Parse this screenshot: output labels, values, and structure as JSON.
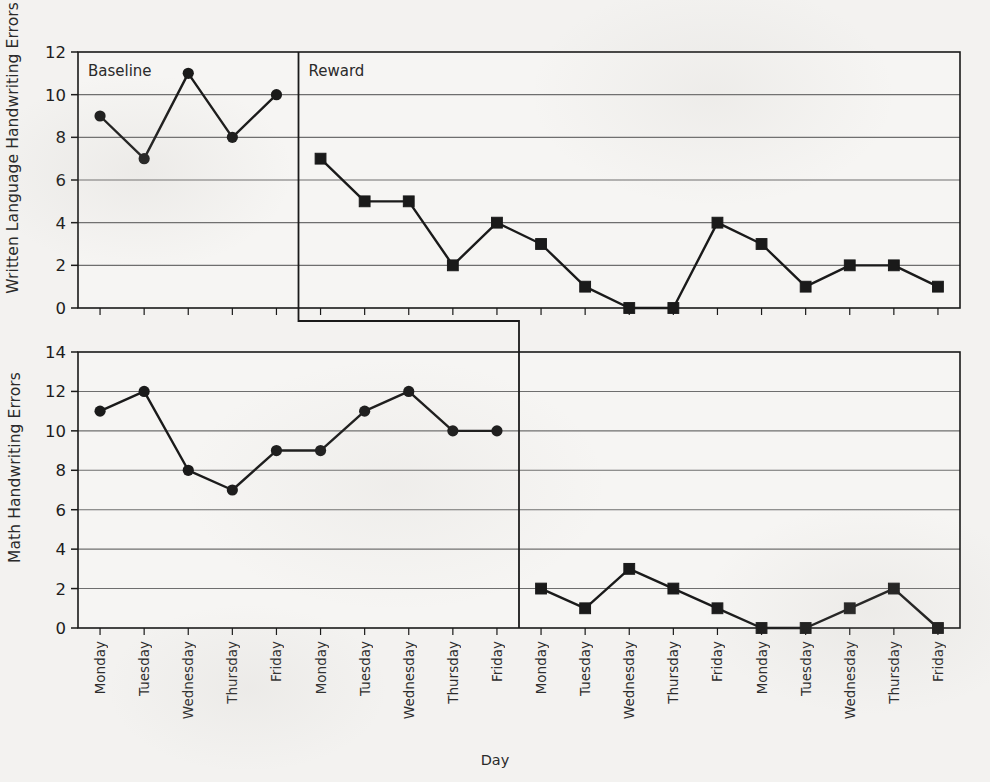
{
  "figure": {
    "xlabel": "Day",
    "x_tick_labels": [
      "Monday",
      "Tuesday",
      "Wednesday",
      "Thursday",
      "Friday",
      "Monday",
      "Tuesday",
      "Wednesday",
      "Thursday",
      "Friday",
      "Monday",
      "Tuesday",
      "Wednesday",
      "Thursday",
      "Friday",
      "Monday",
      "Tuesday",
      "Wednesday",
      "Thursday",
      "Friday"
    ]
  },
  "chart_data": [
    {
      "type": "line",
      "panel": "top",
      "title": "",
      "ylabel": "Written Language Handwriting Errors",
      "xlabel": "Day",
      "ylim": [
        0,
        12
      ],
      "ytick_labels": [
        "0",
        "2",
        "4",
        "6",
        "8",
        "10",
        "12"
      ],
      "yticks": [
        0,
        2,
        4,
        6,
        8,
        10,
        12
      ],
      "grid": true,
      "categories": [
        "Monday",
        "Tuesday",
        "Wednesday",
        "Thursday",
        "Friday",
        "Monday",
        "Tuesday",
        "Wednesday",
        "Thursday",
        "Friday",
        "Monday",
        "Tuesday",
        "Wednesday",
        "Thursday",
        "Friday",
        "Monday",
        "Tuesday",
        "Wednesday",
        "Thursday",
        "Friday"
      ],
      "phase_change_index": 5,
      "series": [
        {
          "name": "Baseline",
          "marker": "circle",
          "x": [
            0,
            1,
            2,
            3,
            4
          ],
          "values": [
            9,
            7,
            11,
            8,
            10
          ]
        },
        {
          "name": "Reward",
          "marker": "square",
          "x": [
            5,
            6,
            7,
            8,
            9,
            10,
            11,
            12,
            13,
            14,
            15,
            16,
            17,
            18,
            19
          ],
          "values": [
            7,
            5,
            5,
            2,
            4,
            3,
            1,
            0,
            0,
            4,
            3,
            1,
            2,
            2,
            1
          ]
        }
      ],
      "annotations": [
        {
          "text": "Baseline",
          "x_index": 0
        },
        {
          "text": "Reward",
          "x_index": 5
        }
      ]
    },
    {
      "type": "line",
      "panel": "bottom",
      "title": "",
      "ylabel": "Math Handwriting Errors",
      "xlabel": "Day",
      "ylim": [
        0,
        14
      ],
      "ytick_labels": [
        "0",
        "2",
        "4",
        "6",
        "8",
        "10",
        "12",
        "14"
      ],
      "yticks": [
        0,
        2,
        4,
        6,
        8,
        10,
        12,
        14
      ],
      "grid": true,
      "categories": [
        "Monday",
        "Tuesday",
        "Wednesday",
        "Thursday",
        "Friday",
        "Monday",
        "Tuesday",
        "Wednesday",
        "Thursday",
        "Friday",
        "Monday",
        "Tuesday",
        "Wednesday",
        "Thursday",
        "Friday",
        "Monday",
        "Tuesday",
        "Wednesday",
        "Thursday",
        "Friday"
      ],
      "phase_change_index": 10,
      "series": [
        {
          "name": "Baseline",
          "marker": "circle",
          "x": [
            0,
            1,
            2,
            3,
            4,
            5,
            6,
            7,
            8,
            9
          ],
          "values": [
            11,
            12,
            8,
            7,
            9,
            9,
            11,
            12,
            10,
            10
          ]
        },
        {
          "name": "Reward",
          "marker": "square",
          "x": [
            10,
            11,
            12,
            13,
            14,
            15,
            16,
            17,
            18,
            19
          ],
          "values": [
            2,
            1,
            3,
            2,
            1,
            0,
            0,
            1,
            2,
            0
          ]
        }
      ],
      "annotations": []
    }
  ],
  "style": {
    "line_color": "#1a1a1a",
    "grid_color": "#6e6e6e",
    "axis_color": "#1a1a1a",
    "background": "#f3f2f0"
  }
}
